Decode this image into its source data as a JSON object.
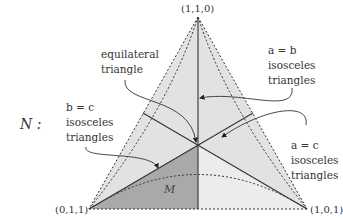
{
  "diagram": {
    "set_label": "N :",
    "region_label": "M",
    "vertices": {
      "top": "(1,1,0)",
      "bottom_left": "(0,1,1)",
      "bottom_right": "(1,0,1)"
    },
    "annotations": {
      "equilateral": [
        "equilateral",
        "triangle"
      ],
      "a_eq_b": [
        "a = b",
        "isosceles",
        "triangles"
      ],
      "b_eq_c": [
        "b = c",
        "isosceles",
        "triangles"
      ],
      "a_eq_c": [
        "a = c",
        "isosceles",
        "triangles"
      ]
    },
    "colors": {
      "fill_light": "#e2e2e2",
      "fill_lighter": "#ececec",
      "fill_dark": "#a9a9a9",
      "line": "#333333"
    }
  }
}
